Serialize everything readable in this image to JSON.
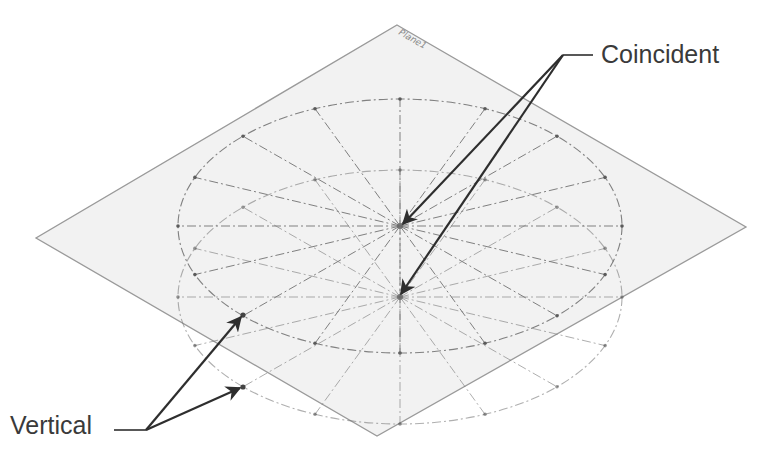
{
  "diagram": {
    "plane_label": "Plane1",
    "callouts": [
      {
        "id": "coincident",
        "label": "Coincident",
        "targets": [
          "upper-ellipse-center",
          "lower-ellipse-center"
        ]
      },
      {
        "id": "vertical",
        "label": "Vertical",
        "targets": [
          "upper-ellipse-point",
          "lower-ellipse-point"
        ]
      }
    ],
    "ellipses": [
      {
        "name": "upper-ellipse",
        "cx": 400,
        "cy": 226,
        "rx": 222,
        "ry": 127,
        "radial_lines": 16
      },
      {
        "name": "lower-ellipse",
        "cx": 400,
        "cy": 297,
        "rx": 222,
        "ry": 127,
        "radial_lines": 16
      }
    ],
    "colors": {
      "plane_fill": "#f2f2f2",
      "plane_edge": "#9a9a9a",
      "construction_line": "#7a7a7a",
      "arrow": "#2e2e2e",
      "text": "#3a3a3a"
    }
  }
}
